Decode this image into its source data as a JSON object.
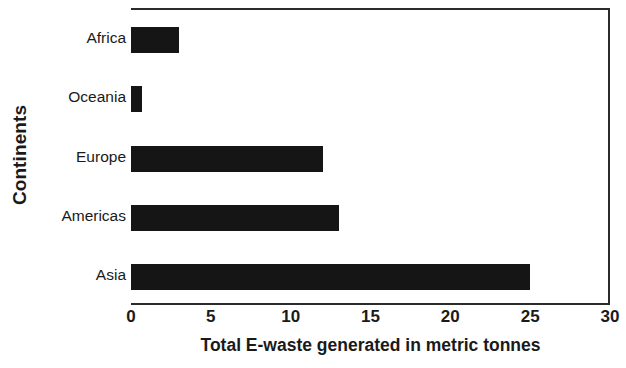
{
  "chart_data": {
    "type": "bar",
    "orientation": "horizontal",
    "title": "",
    "subtitle": "",
    "xlabel": "Total E-waste generated in metric tonnes",
    "ylabel": "Continents",
    "categories": [
      "Africa",
      "Oceania",
      "Europe",
      "Americas",
      "Asia"
    ],
    "values": [
      3,
      0.7,
      12,
      13,
      25
    ],
    "series": [
      {
        "name": "Total E-waste generated in metric tonnes",
        "values": [
          3,
          0.7,
          12,
          13,
          25
        ]
      }
    ],
    "xlim": [
      0,
      30
    ],
    "x_ticks": [
      0,
      5,
      10,
      15,
      20,
      25,
      30
    ],
    "x_tick_labels": [
      "0",
      "5",
      "10",
      "15",
      "20",
      "25",
      "30"
    ],
    "grid": false,
    "legend": false,
    "legend_position": "none",
    "bar_color": "#151515",
    "axis_color": "#2b2b2b",
    "text_color": "#1a1a1a",
    "background_color": "#ffffff",
    "annotations": []
  }
}
